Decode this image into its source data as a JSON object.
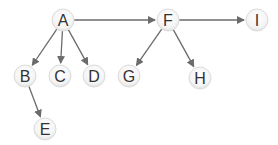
{
  "diagram": {
    "type": "tree",
    "edge_color": "#6b6b6b",
    "node_fill": "#f2f2f2",
    "node_stroke": "#dcdcdc",
    "label_color": "#333333",
    "node_radius": 11,
    "nodes": [
      {
        "id": "A",
        "label": "A",
        "x": 63,
        "y": 20
      },
      {
        "id": "B",
        "label": "B",
        "x": 25,
        "y": 76
      },
      {
        "id": "C",
        "label": "C",
        "x": 60,
        "y": 76
      },
      {
        "id": "D",
        "label": "D",
        "x": 94,
        "y": 76
      },
      {
        "id": "E",
        "label": "E",
        "x": 45,
        "y": 129
      },
      {
        "id": "F",
        "label": "F",
        "x": 168,
        "y": 20
      },
      {
        "id": "G",
        "label": "G",
        "x": 129,
        "y": 76
      },
      {
        "id": "H",
        "label": "H",
        "x": 200,
        "y": 78
      },
      {
        "id": "I",
        "label": "I",
        "x": 257,
        "y": 20
      }
    ],
    "edges": [
      {
        "from": "A",
        "to": "B"
      },
      {
        "from": "A",
        "to": "C"
      },
      {
        "from": "A",
        "to": "D"
      },
      {
        "from": "A",
        "to": "F"
      },
      {
        "from": "B",
        "to": "E"
      },
      {
        "from": "F",
        "to": "G"
      },
      {
        "from": "F",
        "to": "H"
      },
      {
        "from": "F",
        "to": "I"
      }
    ]
  }
}
